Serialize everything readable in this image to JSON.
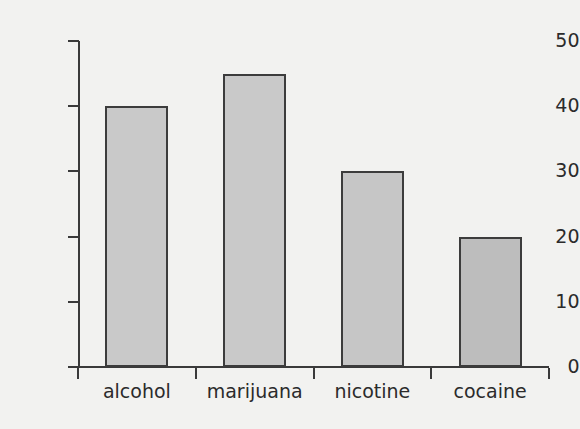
{
  "chart_data": {
    "type": "bar",
    "title": "",
    "subtitle": "",
    "xlabel": "",
    "ylabel": "",
    "categories": [
      "alcohol",
      "marijuana",
      "nicotine",
      "cocaine"
    ],
    "values": [
      40,
      45,
      30,
      20
    ],
    "ylim": [
      0,
      50
    ],
    "ytick_labels": [
      "0",
      "10",
      "20",
      "30",
      "40",
      "50"
    ],
    "ytick_values": [
      0,
      10,
      20,
      30,
      40,
      50
    ],
    "grid": false,
    "legend": null,
    "annotations": [],
    "bar_colors": [
      "#c9c9c9",
      "#c9c9c9",
      "#c6c6c6",
      "#bdbdbd"
    ],
    "bar_border_color": "#3c3c3c",
    "axis_color": "#3a3a3a",
    "text_color": "#2b2b2b",
    "background_color": "#f2f2f0"
  }
}
